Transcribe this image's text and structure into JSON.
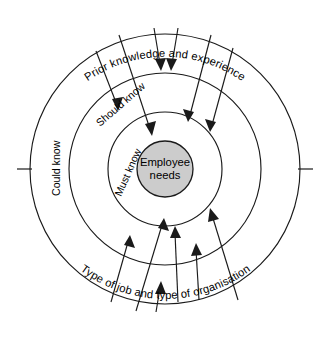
{
  "diagram": {
    "type": "concentric-rings",
    "title_corner_mark": "",
    "center": {
      "x": 165,
      "y": 169
    },
    "core": {
      "label_line_1": "Employee",
      "label_line_2": "needs",
      "radius": 28,
      "fill_color": "#cccccc",
      "stroke_color": "#1a1a1a"
    },
    "rings": [
      {
        "id": "must-know",
        "label": "Must know",
        "radius": 57,
        "label_angle_deg": -55
      },
      {
        "id": "should-know",
        "label": "Should know",
        "radius": 96,
        "label_angle_deg": -40
      },
      {
        "id": "could-know",
        "label": "Could know",
        "radius": 135,
        "label_angle_deg": -90
      }
    ],
    "curved_labels": [
      {
        "id": "top-influence",
        "text": "Prior knowledge and experience",
        "position": "top"
      },
      {
        "id": "bottom-influence",
        "text": "Type of job and type of organisation",
        "position": "bottom"
      }
    ],
    "axis_ticks": [
      {
        "id": "left-tick",
        "side": "left"
      },
      {
        "id": "right-tick",
        "side": "right"
      }
    ],
    "arrows": {
      "top_count": 6,
      "bottom_count": 6,
      "direction": "inward",
      "stroke_color": "#1a1a1a"
    },
    "colors": {
      "line": "#1a1a1a",
      "core_fill": "#cccccc",
      "background": "#ffffff"
    }
  }
}
